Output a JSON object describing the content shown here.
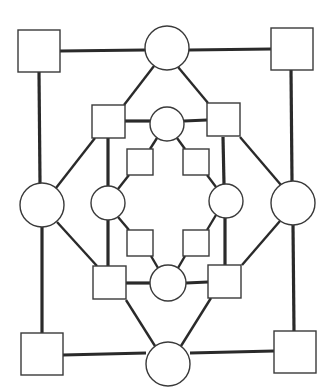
{
  "diagram": {
    "type": "pedigree-like node-link graph",
    "colors": {
      "stroke": "#2a2a2a",
      "node_fill": "#ffffff",
      "background": "#ffffff"
    },
    "nodes": [
      {
        "id": "sq-outer-tl",
        "shape": "square",
        "x": 18,
        "y": 30,
        "size": 42
      },
      {
        "id": "sq-outer-tr",
        "shape": "square",
        "x": 271,
        "y": 28,
        "size": 42
      },
      {
        "id": "sq-outer-bl",
        "shape": "square",
        "x": 21,
        "y": 333,
        "size": 42
      },
      {
        "id": "sq-outer-br",
        "shape": "square",
        "x": 274,
        "y": 331,
        "size": 42
      },
      {
        "id": "ci-outer-top",
        "shape": "circle",
        "cx": 167,
        "cy": 48,
        "r": 22
      },
      {
        "id": "ci-outer-left",
        "shape": "circle",
        "cx": 42,
        "cy": 205,
        "r": 22
      },
      {
        "id": "ci-outer-right",
        "shape": "circle",
        "cx": 293,
        "cy": 203,
        "r": 22
      },
      {
        "id": "ci-outer-bottom",
        "shape": "circle",
        "cx": 168,
        "cy": 364,
        "r": 22
      },
      {
        "id": "sq-mid-tl",
        "shape": "square",
        "x": 92,
        "y": 105,
        "size": 33
      },
      {
        "id": "sq-mid-tr",
        "shape": "square",
        "x": 207,
        "y": 103,
        "size": 33
      },
      {
        "id": "sq-mid-bl",
        "shape": "square",
        "x": 93,
        "y": 266,
        "size": 33
      },
      {
        "id": "sq-mid-br",
        "shape": "square",
        "x": 208,
        "y": 265,
        "size": 33
      },
      {
        "id": "ci-mid-top",
        "shape": "circle",
        "cx": 167,
        "cy": 124,
        "r": 17
      },
      {
        "id": "ci-mid-left",
        "shape": "circle",
        "cx": 108,
        "cy": 203,
        "r": 17
      },
      {
        "id": "ci-mid-right",
        "shape": "circle",
        "cx": 226,
        "cy": 201,
        "r": 17
      },
      {
        "id": "ci-mid-bottom",
        "shape": "circle",
        "cx": 168,
        "cy": 283,
        "r": 18
      },
      {
        "id": "sq-inner-tl",
        "shape": "square",
        "x": 127,
        "y": 149,
        "size": 26
      },
      {
        "id": "sq-inner-tr",
        "shape": "square",
        "x": 183,
        "y": 149,
        "size": 26
      },
      {
        "id": "sq-inner-bl",
        "shape": "square",
        "x": 127,
        "y": 230,
        "size": 26
      },
      {
        "id": "sq-inner-br",
        "shape": "square",
        "x": 183,
        "y": 230,
        "size": 26
      }
    ],
    "edges": [
      {
        "from": "sq-outer-tl",
        "to": "ci-outer-top",
        "x1": 60,
        "y1": 51,
        "x2": 145,
        "y2": 50,
        "w": "thick"
      },
      {
        "from": "ci-outer-top",
        "to": "sq-outer-tr",
        "x1": 189,
        "y1": 50,
        "x2": 271,
        "y2": 49,
        "w": "thick"
      },
      {
        "from": "sq-outer-tl",
        "to": "ci-outer-left",
        "x1": 39,
        "y1": 72,
        "x2": 40,
        "y2": 183,
        "w": "thick"
      },
      {
        "from": "sq-outer-tr",
        "to": "ci-outer-right",
        "x1": 291,
        "y1": 70,
        "x2": 292,
        "y2": 181,
        "w": "thick"
      },
      {
        "from": "ci-outer-left",
        "to": "sq-outer-bl",
        "x1": 42,
        "y1": 227,
        "x2": 42,
        "y2": 333,
        "w": "thick"
      },
      {
        "from": "ci-outer-right",
        "to": "sq-outer-br",
        "x1": 293,
        "y1": 225,
        "x2": 294,
        "y2": 331,
        "w": "thick"
      },
      {
        "from": "sq-outer-bl",
        "to": "ci-outer-bottom",
        "x1": 63,
        "y1": 355,
        "x2": 146,
        "y2": 353,
        "w": "thick"
      },
      {
        "from": "ci-outer-bottom",
        "to": "sq-outer-br",
        "x1": 190,
        "y1": 353,
        "x2": 274,
        "y2": 351,
        "w": "thick"
      },
      {
        "from": "ci-outer-top",
        "to": "sq-mid-tl",
        "x1": 154,
        "y1": 66,
        "x2": 124,
        "y2": 105,
        "w": "mid"
      },
      {
        "from": "ci-outer-top",
        "to": "sq-mid-tr",
        "x1": 178,
        "y1": 67,
        "x2": 208,
        "y2": 103,
        "w": "mid"
      },
      {
        "from": "sq-mid-tl",
        "to": "ci-outer-left",
        "x1": 95,
        "y1": 138,
        "x2": 56,
        "y2": 188,
        "w": "mid"
      },
      {
        "from": "sq-mid-tr",
        "to": "ci-outer-right",
        "x1": 240,
        "y1": 137,
        "x2": 281,
        "y2": 185,
        "w": "mid"
      },
      {
        "from": "ci-outer-left",
        "to": "sq-mid-bl",
        "x1": 57,
        "y1": 222,
        "x2": 97,
        "y2": 266,
        "w": "mid"
      },
      {
        "from": "ci-outer-right",
        "to": "sq-mid-br",
        "x1": 280,
        "y1": 221,
        "x2": 242,
        "y2": 265,
        "w": "mid"
      },
      {
        "from": "sq-mid-bl",
        "to": "ci-outer-bottom",
        "x1": 126,
        "y1": 300,
        "x2": 155,
        "y2": 346,
        "w": "mid"
      },
      {
        "from": "sq-mid-br",
        "to": "ci-outer-bottom",
        "x1": 211,
        "y1": 298,
        "x2": 181,
        "y2": 346,
        "w": "mid"
      },
      {
        "from": "sq-mid-tl",
        "to": "ci-mid-top",
        "x1": 124,
        "y1": 121,
        "x2": 150,
        "y2": 121,
        "w": "thick"
      },
      {
        "from": "ci-mid-top",
        "to": "sq-mid-tr",
        "x1": 184,
        "y1": 121,
        "x2": 207,
        "y2": 120,
        "w": "thick"
      },
      {
        "from": "sq-mid-tl",
        "to": "ci-mid-left",
        "x1": 108,
        "y1": 138,
        "x2": 108,
        "y2": 186,
        "w": "thick"
      },
      {
        "from": "sq-mid-tr",
        "to": "ci-mid-right",
        "x1": 223,
        "y1": 137,
        "x2": 224,
        "y2": 184,
        "w": "thick"
      },
      {
        "from": "ci-mid-left",
        "to": "sq-mid-bl",
        "x1": 108,
        "y1": 220,
        "x2": 108,
        "y2": 266,
        "w": "thick"
      },
      {
        "from": "ci-mid-right",
        "to": "sq-mid-br",
        "x1": 225,
        "y1": 218,
        "x2": 225,
        "y2": 265,
        "w": "thick"
      },
      {
        "from": "sq-mid-bl",
        "to": "ci-mid-bottom",
        "x1": 126,
        "y1": 283,
        "x2": 150,
        "y2": 283,
        "w": "thick"
      },
      {
        "from": "ci-mid-bottom",
        "to": "sq-mid-br",
        "x1": 186,
        "y1": 283,
        "x2": 208,
        "y2": 282,
        "w": "thick"
      },
      {
        "from": "ci-mid-top",
        "to": "sq-inner-tl",
        "x1": 157,
        "y1": 138,
        "x2": 150,
        "y2": 149,
        "w": "mid"
      },
      {
        "from": "ci-mid-top",
        "to": "sq-inner-tr",
        "x1": 177,
        "y1": 138,
        "x2": 185,
        "y2": 149,
        "w": "mid"
      },
      {
        "from": "sq-inner-tl",
        "to": "ci-mid-left",
        "x1": 129,
        "y1": 175,
        "x2": 118,
        "y2": 189,
        "w": "mid"
      },
      {
        "from": "sq-inner-tr",
        "to": "ci-mid-right",
        "x1": 207,
        "y1": 175,
        "x2": 216,
        "y2": 187,
        "w": "mid"
      },
      {
        "from": "ci-mid-left",
        "to": "sq-inner-bl",
        "x1": 118,
        "y1": 217,
        "x2": 129,
        "y2": 230,
        "w": "mid"
      },
      {
        "from": "ci-mid-right",
        "to": "sq-inner-br",
        "x1": 216,
        "y1": 215,
        "x2": 207,
        "y2": 230,
        "w": "mid"
      },
      {
        "from": "sq-inner-bl",
        "to": "ci-mid-bottom",
        "x1": 151,
        "y1": 256,
        "x2": 158,
        "y2": 268,
        "w": "mid"
      },
      {
        "from": "sq-inner-br",
        "to": "ci-mid-bottom",
        "x1": 185,
        "y1": 256,
        "x2": 178,
        "y2": 268,
        "w": "mid"
      }
    ]
  }
}
